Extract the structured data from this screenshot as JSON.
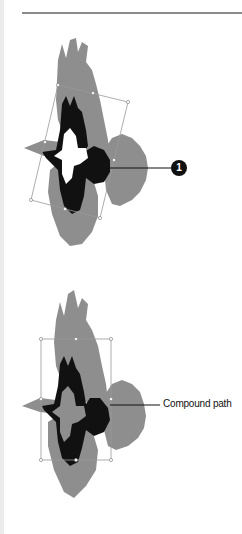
{
  "figure_1": {
    "description": "Bird illustration selected with rotated bounding box",
    "callout_number": "1",
    "colors": {
      "shadow": "#8e8e8e",
      "body": "#111111",
      "highlight": "#ffffff",
      "handle": "#999999"
    }
  },
  "figure_2": {
    "description": "Bird illustration selected as compound path",
    "callout_label": "Compound path",
    "colors": {
      "shadow": "#8e8e8e",
      "body": "#111111",
      "highlight": "#8e8e8e",
      "handle": "#999999"
    }
  }
}
